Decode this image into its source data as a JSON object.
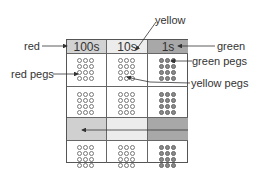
{
  "diagram": {
    "columns": [
      {
        "id": "hundreds",
        "header": "100s",
        "color_name": "red",
        "header_fill": "#d2d2d2",
        "shaded_fill": "#d0d0d0"
      },
      {
        "id": "tens",
        "header": "10s",
        "color_name": "yellow",
        "header_fill": "#ececec",
        "shaded_fill": "#ececec"
      },
      {
        "id": "ones",
        "header": "1s",
        "color_name": "green",
        "header_fill": "#a8a8a8",
        "shaded_fill": "#a8a8a8"
      }
    ],
    "rows": [
      {
        "type": "header"
      },
      {
        "type": "pegs",
        "pegs_per_cell": 12
      },
      {
        "type": "pegs",
        "pegs_per_cell": 12
      },
      {
        "type": "shaded",
        "arrow": "right-to-left"
      },
      {
        "type": "pegs",
        "pegs_per_cell": 12
      }
    ],
    "annotations": {
      "red": "red",
      "yellow": "yellow",
      "green": "green",
      "red_pegs": "red pegs",
      "green_pegs": "green pegs",
      "yellow_pegs": "yellow pegs"
    },
    "colors": {
      "grid_line": "#555555",
      "peg_outline": "#777777",
      "green_peg_fill": "#8a8a8a",
      "arrow": "#333333"
    }
  }
}
